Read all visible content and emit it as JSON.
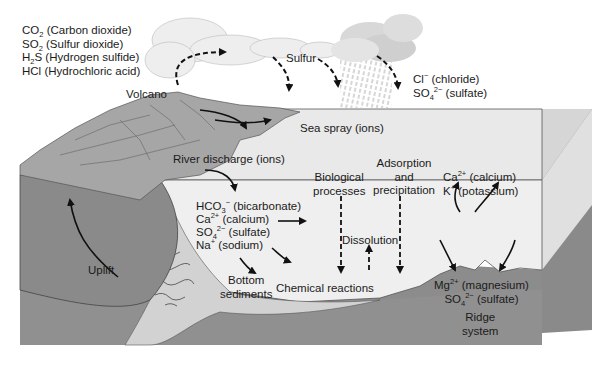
{
  "diagram": {
    "type": "ocean-chemistry-schematic",
    "colors": {
      "background": "#ffffff",
      "seawater_top": "#e6e6e6",
      "seawater_front": "#ededed",
      "seawater_side": "#d2d2d2",
      "crust": "#8e8e8e",
      "crust_dark": "#7a7a7a",
      "land": "#a8a8a8",
      "sediment": "#d0d0d0",
      "arrow": "#111111"
    },
    "volcanic_gases": [
      {
        "formula": "CO",
        "sub": "2",
        "name": "(Carbon dioxide)"
      },
      {
        "formula": "SO",
        "sub": "2",
        "name": "(Sulfur dioxide)"
      },
      {
        "formula": "H",
        "sub": "2",
        "formula_tail": "S",
        "name": "(Hydrogen sulfide)"
      },
      {
        "formula": "HCl",
        "name": "(Hydrochloric acid)"
      }
    ],
    "labels": {
      "volcano": "Volcano",
      "sulfur": "Sulfur",
      "rain_ion1_formula": "Cl",
      "rain_ion1_sup": "−",
      "rain_ion1_name": "(chloride)",
      "rain_ion2_formula": "SO",
      "rain_ion2_sub": "4",
      "rain_ion2_sup": "2−",
      "rain_ion2_name": "(sulfate)",
      "sea_spray": "Sea spray (ions)",
      "river_discharge": "River discharge (ions)",
      "biological_line1": "Biological",
      "biological_line2": "processes",
      "adsorption_line1": "Adsorption",
      "adsorption_line2": "and",
      "adsorption_line3": "precipitation",
      "dissolution": "Dissolution",
      "chemical_reactions": "Chemical reactions",
      "bottom_sediments_line1": "Bottom",
      "bottom_sediments_line2": "sediments",
      "uplift": "Uplift",
      "ridge_line1": "Ridge",
      "ridge_line2": "system"
    },
    "river_ions": [
      {
        "formula": "HCO",
        "sub": "3",
        "sup": "−",
        "name": "(bicarbonate)"
      },
      {
        "formula": "Ca",
        "sup": "2+",
        "name": "(calcium)"
      },
      {
        "formula": "SO",
        "sub": "4",
        "sup": "2−",
        "name": "(sulfate)"
      },
      {
        "formula": "Na",
        "sup": "+",
        "name": "(sodium)"
      }
    ],
    "ridge_outputs": [
      {
        "formula": "Ca",
        "sup": "2+",
        "name": "(calcium)"
      },
      {
        "formula": "K",
        "sup": "+",
        "name": "(potassium)"
      }
    ],
    "ridge_inputs": [
      {
        "formula": "Mg",
        "sup": "2+",
        "name": "(magnesium)"
      },
      {
        "formula": "SO",
        "sub": "4",
        "sup": "2−",
        "name": "(sulfate)"
      }
    ]
  }
}
